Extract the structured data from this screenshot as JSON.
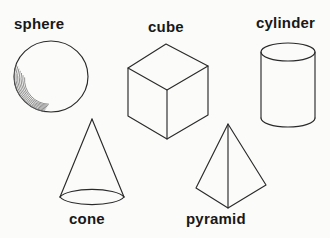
{
  "figure": {
    "background_color": "#fbfbfa",
    "stroke_color": "#2a2a2a",
    "label_color": "#181818",
    "shading_color": "#6d6d6d"
  },
  "shapes": [
    {
      "id": "sphere",
      "label": "sphere",
      "kind": "sphere",
      "label_position": "above",
      "shading": "crescent hatching lower-left"
    },
    {
      "id": "cube",
      "label": "cube",
      "kind": "cube",
      "label_position": "above",
      "shading": "none"
    },
    {
      "id": "cylinder",
      "label": "cylinder",
      "kind": "cylinder",
      "label_position": "above",
      "shading": "none"
    },
    {
      "id": "cone",
      "label": "cone",
      "kind": "cone",
      "label_position": "below",
      "shading": "none"
    },
    {
      "id": "pyramid",
      "label": "pyramid",
      "kind": "square-pyramid",
      "label_position": "below",
      "shading": "none"
    }
  ]
}
